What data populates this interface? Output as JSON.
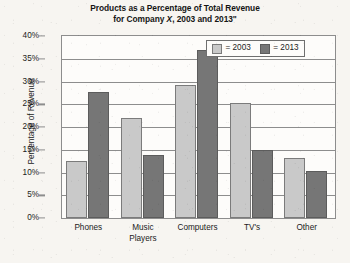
{
  "chart_data": {
    "type": "bar",
    "title": "Products as a Percentage of Total Revenue for Company X, 2003 and 2013\"",
    "title_line1": "Products as a Percentage of Total Revenue",
    "title_line2_pre": "for Company ",
    "title_line2_italic": "X",
    "title_line2_post": ", 2003 and 2013\"",
    "xlabel": "",
    "ylabel": "Percentage of Revenue",
    "categories": [
      "Phones",
      "Music Players",
      "Computers",
      "TV's",
      "Other"
    ],
    "category_lines": [
      [
        "Phones"
      ],
      [
        "Music",
        "Players"
      ],
      [
        "Computers"
      ],
      [
        "TV's"
      ],
      [
        "Other"
      ]
    ],
    "series": [
      {
        "name": "2003",
        "color": "#c9c9c9",
        "values": [
          12.5,
          22.0,
          29.3,
          25.3,
          13.3
        ]
      },
      {
        "name": "2013",
        "color": "#767676",
        "values": [
          27.8,
          13.8,
          37.0,
          15.0,
          10.3
        ]
      }
    ],
    "ylim": [
      0,
      40
    ],
    "ytick_values": [
      0,
      5,
      10,
      15,
      20,
      25,
      30,
      35,
      40
    ],
    "ytick_labels": [
      "0%",
      "5%",
      "10%",
      "15%",
      "20%",
      "25%",
      "30%",
      "35%",
      "40%"
    ],
    "grid": true,
    "legend_position": "inside-top-right",
    "legend_entries": [
      {
        "label": "= 2003",
        "color": "#c9c9c9"
      },
      {
        "label": "= 2013",
        "color": "#767676"
      }
    ]
  },
  "colors": {
    "series_2003": "#c9c9c9",
    "series_2013": "#767676",
    "gridline": "#8d8d8d",
    "axis": "#8d8d8d",
    "text": "#1b1b1b",
    "plot_background": "#fdfcfa",
    "page_background": "#f7f5f1"
  }
}
